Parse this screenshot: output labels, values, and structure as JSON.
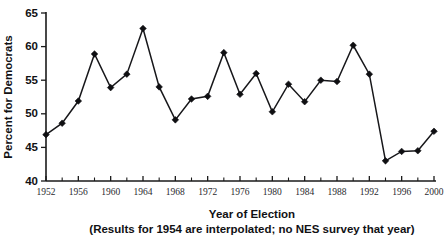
{
  "chart_data": {
    "type": "line",
    "title": "",
    "xlabel": "Year of Election",
    "xlabel_note": "(Results for 1954 are interpolated; no NES survey that year)",
    "ylabel": "Percent for Democrats",
    "xlim": [
      1952,
      2000
    ],
    "ylim": [
      40,
      65
    ],
    "grid": false,
    "legend": "none",
    "ytick_labels": [
      "40",
      "45",
      "50",
      "55",
      "60",
      "65"
    ],
    "ytick_values": [
      40,
      45,
      50,
      55,
      60,
      65
    ],
    "xtick_labels": [
      "1952",
      "1956",
      "1960",
      "1964",
      "1968",
      "1972",
      "1976",
      "1980",
      "1984",
      "1988",
      "1992",
      "1996",
      "2000"
    ],
    "xtick_values": [
      1952,
      1956,
      1960,
      1964,
      1968,
      1972,
      1976,
      1980,
      1984,
      1988,
      1992,
      1996,
      2000
    ],
    "xminor_values": [
      1954,
      1958,
      1962,
      1966,
      1970,
      1974,
      1978,
      1982,
      1986,
      1990,
      1994,
      1998
    ],
    "x": [
      1952,
      1954,
      1956,
      1958,
      1960,
      1962,
      1964,
      1966,
      1968,
      1970,
      1972,
      1974,
      1976,
      1978,
      1980,
      1982,
      1984,
      1986,
      1988,
      1990,
      1992,
      1994,
      1996,
      1998,
      2000
    ],
    "values": [
      46.9,
      48.6,
      51.9,
      58.9,
      53.9,
      55.9,
      62.7,
      54.0,
      49.1,
      52.2,
      52.6,
      59.1,
      52.9,
      56.0,
      50.3,
      54.4,
      51.8,
      55.0,
      54.8,
      60.2,
      55.9,
      43.0,
      44.4,
      44.5,
      47.4
    ],
    "marker": "diamond",
    "line_color": "#17171a",
    "marker_color": "#0f0f12"
  }
}
